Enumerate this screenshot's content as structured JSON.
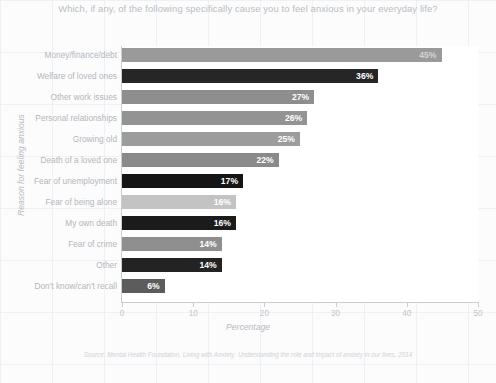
{
  "chart_data": {
    "type": "bar",
    "orientation": "horizontal",
    "title": "Which, if any, of the following specifically cause you to feel anxious in your everyday life?",
    "xlabel": "Percentage",
    "ylabel": "Reason for feeling anxious",
    "xlim": [
      0,
      50
    ],
    "xticks": [
      0,
      10,
      20,
      30,
      40,
      50
    ],
    "xtick_labels": [
      "0",
      "10",
      "20",
      "30",
      "40",
      "50"
    ],
    "grid": false,
    "legend": "none",
    "value_suffix": "%",
    "source": "Source: Mental Health Foundation, Living with Anxiety: Understanding the role and impact of anxiety in our lives, 2014",
    "categories": [
      "Money/finance/debt",
      "Welfare of loved ones",
      "Other work issues",
      "Personal relationships",
      "Growing old",
      "Death of a loved one",
      "Fear of unemployment",
      "Fear of being alone",
      "My own death",
      "Fear of crime",
      "Other",
      "Don't know/can't recall"
    ],
    "values": [
      45,
      36,
      27,
      26,
      25,
      22,
      17,
      16,
      16,
      14,
      14,
      6
    ],
    "value_labels": [
      "45%",
      "36%",
      "27%",
      "26%",
      "25%",
      "22%",
      "17%",
      "16%",
      "16%",
      "14%",
      "14%",
      "6%"
    ],
    "bar_colors": [
      "#9a9a9a",
      "#262626",
      "#8e8e8e",
      "#939393",
      "#9c9c9c",
      "#8a8a8a",
      "#151515",
      "#c3c3c3",
      "#1b1b1b",
      "#8f8f8f",
      "#232323",
      "#5c5c5c"
    ],
    "label_positions": [
      "outside",
      "inside",
      "inside",
      "inside",
      "inside",
      "inside",
      "inside",
      "inside",
      "inside",
      "inside",
      "inside",
      "inside"
    ]
  },
  "colors": {
    "background": "#fcfcfd",
    "plot_background": "#ffffff",
    "axis": "#c9ced3",
    "title_text": "#b9bdc2",
    "label_text": "#b2b7bc"
  }
}
